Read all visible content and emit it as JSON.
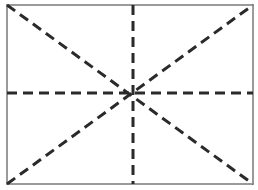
{
  "diagram": {
    "colors": {
      "background": "#ffffff",
      "frame": "#9a9a9a",
      "dashed_line": "#2a2a2a"
    },
    "frame": {
      "x": 7,
      "y": 5,
      "width": 246,
      "height": 179
    },
    "center": {
      "x": 133,
      "y": 93
    },
    "lines": [
      {
        "name": "diagonal-top-left-to-bottom-right",
        "x1": 7,
        "y1": 5,
        "x2": 253,
        "y2": 184
      },
      {
        "name": "diagonal-bottom-left-to-top-right",
        "x1": 7,
        "y1": 184,
        "x2": 253,
        "y2": 5
      },
      {
        "name": "vertical-midline",
        "x1": 133,
        "y1": 5,
        "x2": 133,
        "y2": 184
      },
      {
        "name": "horizontal-midline",
        "x1": 7,
        "y1": 93,
        "x2": 253,
        "y2": 93
      }
    ],
    "dash_pattern": "10 6",
    "stroke_width": 3
  }
}
